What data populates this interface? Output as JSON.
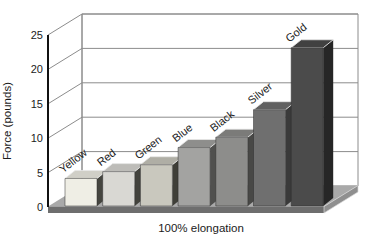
{
  "figure": {
    "background": "#ffffff"
  },
  "chart_data": {
    "type": "bar",
    "projection": "3d",
    "title": "",
    "categories": [
      "Yellow",
      "Red",
      "Green",
      "Blue",
      "Black",
      "Silver",
      "Gold"
    ],
    "values": [
      4,
      5,
      6,
      8.5,
      10,
      14,
      23
    ],
    "xlabel": "100% elongation",
    "ylabel": "Force (pounds)",
    "ylim": [
      0,
      25
    ],
    "yticks": [
      0,
      5,
      10,
      15,
      20,
      25
    ],
    "grid": true,
    "legend_position": "none",
    "bar_front_colors": [
      "#efeee5",
      "#d9d8d3",
      "#c9c8be",
      "#a3a3a1",
      "#8d8d8b",
      "#6f6f6f",
      "#4b4b4b"
    ],
    "bar_side_colors": [
      "#45453f",
      "#42423c",
      "#3f3f38",
      "#50504e",
      "#484846",
      "#3a3a3a",
      "#262626"
    ],
    "floor_top_color": "#a9a9a9",
    "floor_front_color": "#6e6e6e",
    "floor_bevel_color": "#8f8f8f",
    "wall_color": "#ffffff",
    "gridline_color": "#8c8c8c",
    "axis_color": "#111111",
    "text_color": "#1b1b1b"
  }
}
